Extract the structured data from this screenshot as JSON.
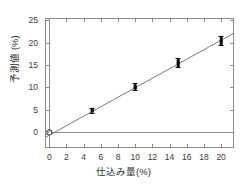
{
  "chart_data": {
    "type": "scatter",
    "title": "",
    "xlabel": "仕込み量(%)",
    "ylabel": "予測値 (%)",
    "xlim": [
      -0.5,
      21.5
    ],
    "ylim": [
      -3.5,
      25.5
    ],
    "xticks": [
      0,
      2,
      4,
      6,
      8,
      10,
      12,
      14,
      16,
      18,
      20
    ],
    "yticks": [
      0,
      5,
      10,
      15,
      20,
      25
    ],
    "xtick_labels": [
      "0",
      "2",
      "4",
      "6",
      "8",
      "10",
      "12",
      "14",
      "16",
      "18",
      "20"
    ],
    "ytick_labels": [
      "0",
      "5",
      "10",
      "15",
      "20",
      "25"
    ],
    "grid": false,
    "legend": null,
    "series": [
      {
        "name": "予測値",
        "marker": "filled-circle",
        "x": [
          0,
          0,
          0,
          5,
          5,
          5,
          5,
          5,
          10,
          10,
          10,
          10,
          10,
          10,
          15,
          15,
          15,
          15,
          15,
          15,
          15,
          20,
          20,
          20,
          20,
          20,
          20,
          20
        ],
        "y": [
          0.0,
          0.1,
          -0.1,
          4.6,
          4.8,
          5.0,
          5.2,
          4.9,
          9.7,
          9.9,
          10.1,
          10.3,
          10.6,
          10.0,
          14.8,
          15.1,
          15.3,
          15.6,
          15.9,
          16.2,
          15.4,
          19.7,
          20.0,
          20.3,
          20.6,
          20.9,
          21.2,
          20.4
        ]
      }
    ],
    "error_bars": [
      {
        "x": 0,
        "y": 0.0,
        "low": -0.4,
        "high": 0.4
      },
      {
        "x": 5,
        "y": 4.9,
        "low": 4.4,
        "high": 5.4
      },
      {
        "x": 10,
        "y": 10.1,
        "low": 9.4,
        "high": 10.9
      },
      {
        "x": 15,
        "y": 15.5,
        "low": 14.6,
        "high": 16.5
      },
      {
        "x": 20,
        "y": 20.5,
        "low": 19.4,
        "high": 21.5
      }
    ],
    "fit_line": {
      "name": "regression",
      "slope": 1.06,
      "intercept": -0.65,
      "x_start": -0.5,
      "x_end": 21.5,
      "y_start": -1.18,
      "y_end": 22.14
    },
    "reference_lines": [
      {
        "orientation": "horizontal",
        "value": 0
      },
      {
        "orientation": "vertical",
        "value": 0
      }
    ]
  }
}
